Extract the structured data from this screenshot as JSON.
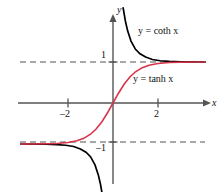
{
  "chart_data": {
    "type": "line",
    "title": "",
    "xlabel": "x",
    "ylabel": "y",
    "xlim": [
      -4.2,
      4.1
    ],
    "ylim": [
      -2.1,
      2.1
    ],
    "grid": false,
    "legend_position": "inline-annotations",
    "axis_color": "#555555",
    "asymptote_color": "#555555",
    "series": [
      {
        "name": "y = coth x",
        "label_text": "y = coth x",
        "color": "#000000",
        "style": "solid",
        "branches": [
          {
            "name": "positive-branch",
            "x": [
              0.45,
              0.55,
              0.65,
              0.8,
              1.0,
              1.2,
              1.45,
              1.75,
              2.1,
              2.5,
              3.0,
              3.6,
              4.1
            ],
            "y": [
              2.32,
              2.0,
              1.76,
              1.51,
              1.31,
              1.2,
              1.12,
              1.06,
              1.03,
              1.014,
              1.005,
              1.0015,
              1.0
            ]
          },
          {
            "name": "negative-branch",
            "x": [
              -4.1,
              -3.6,
              -3.0,
              -2.5,
              -2.1,
              -1.75,
              -1.45,
              -1.2,
              -1.0,
              -0.8,
              -0.65,
              -0.55,
              -0.45
            ],
            "y": [
              -1.0,
              -1.0015,
              -1.005,
              -1.014,
              -1.03,
              -1.06,
              -1.12,
              -1.2,
              -1.31,
              -1.51,
              -1.76,
              -2.0,
              -2.32
            ]
          }
        ]
      },
      {
        "name": "y = tanh x",
        "label_text": "y = tanh x",
        "color": "#d9334a",
        "style": "solid",
        "x": [
          -4.1,
          -3.5,
          -3.0,
          -2.5,
          -2.0,
          -1.6,
          -1.3,
          -1.0,
          -0.75,
          -0.5,
          -0.25,
          0,
          0.25,
          0.5,
          0.75,
          1.0,
          1.3,
          1.6,
          2.0,
          2.5,
          3.0,
          3.5,
          4.1
        ],
        "y": [
          -0.9994,
          -0.9982,
          -0.995,
          -0.9866,
          -0.964,
          -0.9217,
          -0.8617,
          -0.7616,
          -0.6351,
          -0.4621,
          -0.2449,
          0,
          0.2449,
          0.4621,
          0.6351,
          0.7616,
          0.8617,
          0.9217,
          0.964,
          0.9866,
          0.995,
          0.9982,
          0.9994
        ]
      }
    ],
    "asymptotes": [
      {
        "name": "upper-asymptote",
        "value": 1,
        "style": "dashed",
        "orientation": "horizontal"
      },
      {
        "name": "lower-asymptote",
        "value": -1,
        "style": "dashed",
        "orientation": "horizontal"
      }
    ],
    "x_ticks": [
      {
        "value": -2,
        "label": "–2"
      },
      {
        "value": 2,
        "label": "2"
      }
    ],
    "y_ticks": [
      {
        "value": 1,
        "label": "1"
      },
      {
        "value": -1,
        "label": "–1"
      }
    ]
  },
  "labels": {
    "y_axis": "y",
    "x_axis": "x",
    "tick_minus2": "–2",
    "tick_2": "2",
    "tick_1": "1",
    "tick_minus1": "–1",
    "coth_label": "y = coth x",
    "tanh_label": "y = tanh x"
  }
}
